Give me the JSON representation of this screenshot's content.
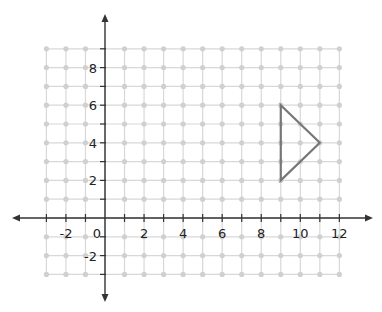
{
  "chart_data": {
    "type": "scatter",
    "title": "",
    "xlabel": "",
    "ylabel": "",
    "xlim": [
      -3,
      12
    ],
    "ylim": [
      -3,
      9
    ],
    "grid": true,
    "x_tick_labels": [
      "-2",
      "0",
      "2",
      "4",
      "6",
      "8",
      "10",
      "12"
    ],
    "y_tick_labels": [
      "8",
      "6",
      "4",
      "2",
      "-2"
    ],
    "shapes": [
      {
        "name": "triangle",
        "vertices": [
          [
            9,
            6
          ],
          [
            11,
            4
          ],
          [
            9,
            2
          ]
        ],
        "stroke": "#777777"
      }
    ]
  },
  "colors": {
    "grid": "#d8d8d8",
    "grid_dot": "#d0d0d0",
    "axis": "#333333",
    "shape": "#777777"
  }
}
